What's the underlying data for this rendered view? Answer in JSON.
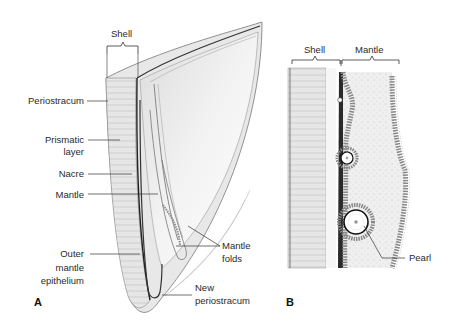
{
  "figure": {
    "panels": [
      {
        "id": "A",
        "letter": "A",
        "labels": {
          "shell": "Shell",
          "periostracum": "Periostracum",
          "prismatic_1": "Prismatic",
          "prismatic_2": "layer",
          "nacre": "Nacre",
          "mantle": "Mantle",
          "outer_1": "Outer",
          "outer_2": "mantle",
          "outer_3": "epithelium",
          "mantle_folds_1": "Mantle",
          "mantle_folds_2": "folds",
          "new_perio_1": "New",
          "new_perio_2": "periostracum"
        }
      },
      {
        "id": "B",
        "letter": "B",
        "labels": {
          "shell": "Shell",
          "mantle": "Mantle",
          "pearl": "Pearl"
        }
      }
    ],
    "colors": {
      "line": "#333333",
      "shell_fill": "#e4e4e4",
      "mantle_fill": "#ececec",
      "dark_layer": "#2a2a2a"
    }
  }
}
